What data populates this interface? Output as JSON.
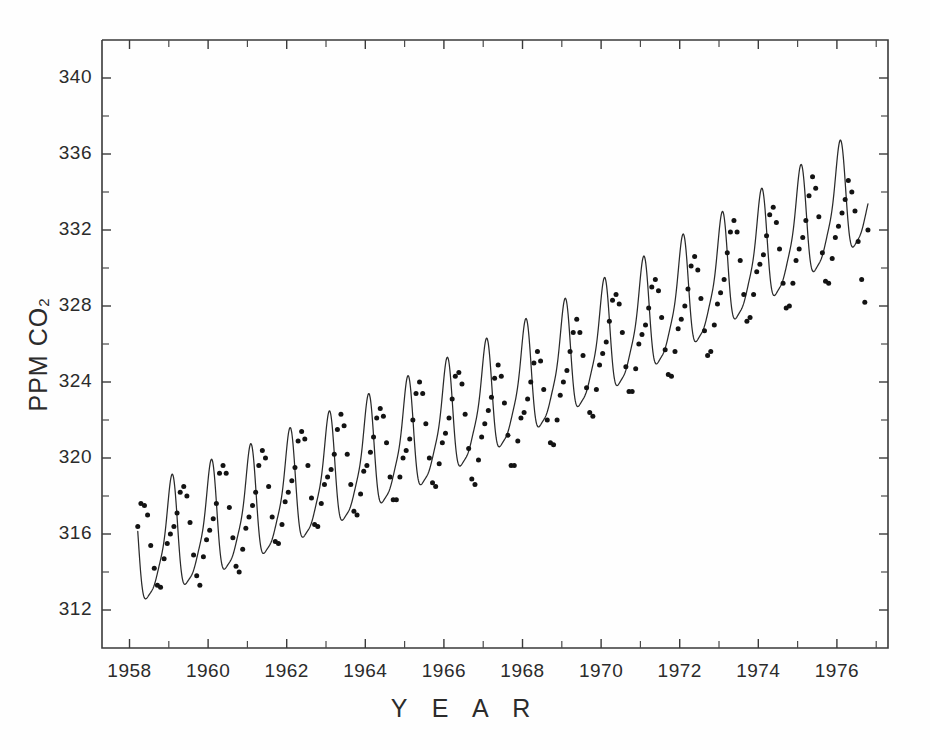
{
  "figure": {
    "background": "#fefefe",
    "ink_color": "#2b2b2b"
  },
  "axes": {
    "x_title": "Y E A R",
    "y_title_main": "PPM CO",
    "y_title_sub": "2",
    "x_tick_labels": [
      "1958",
      "1960",
      "1962",
      "1964",
      "1966",
      "1968",
      "1970",
      "1972",
      "1974",
      "1976"
    ],
    "y_tick_labels": [
      "340",
      "336",
      "332",
      "328",
      "324",
      "320",
      "316",
      "312"
    ]
  },
  "chart_data": {
    "type": "line",
    "title": "",
    "subtitle": "",
    "xlabel": "Y E A R",
    "ylabel": "PPM CO2",
    "xlim": [
      1957.3,
      1977.3
    ],
    "ylim": [
      310.0,
      342.0
    ],
    "grid": false,
    "legend": null,
    "x_major_ticks": [
      1958,
      1960,
      1962,
      1964,
      1966,
      1968,
      1970,
      1972,
      1974,
      1976
    ],
    "x_minor_ticks": [
      1959,
      1961,
      1963,
      1965,
      1967,
      1969,
      1971,
      1973,
      1975,
      1977
    ],
    "y_major_ticks": [
      312,
      316,
      320,
      324,
      328,
      332,
      336,
      340
    ],
    "y_minor_ticks": [
      314,
      318,
      322,
      326,
      330,
      334,
      338
    ],
    "series": [
      {
        "name": "Monthly mean CO2 (Mauna Loa)",
        "marker": "dot",
        "x": [
          1958.21,
          1958.29,
          1958.38,
          1958.46,
          1958.54,
          1958.63,
          1958.71,
          1958.79,
          1958.88,
          1958.96,
          1959.04,
          1959.13,
          1959.21,
          1959.29,
          1959.38,
          1959.46,
          1959.54,
          1959.63,
          1959.71,
          1959.79,
          1959.88,
          1959.96,
          1960.04,
          1960.13,
          1960.21,
          1960.29,
          1960.38,
          1960.46,
          1960.54,
          1960.63,
          1960.71,
          1960.79,
          1960.88,
          1960.96,
          1961.04,
          1961.13,
          1961.21,
          1961.29,
          1961.38,
          1961.46,
          1961.54,
          1961.63,
          1961.71,
          1961.79,
          1961.88,
          1961.96,
          1962.04,
          1962.13,
          1962.21,
          1962.29,
          1962.38,
          1962.46,
          1962.54,
          1962.63,
          1962.71,
          1962.79,
          1962.88,
          1962.96,
          1963.04,
          1963.13,
          1963.21,
          1963.29,
          1963.38,
          1963.46,
          1963.54,
          1963.63,
          1963.71,
          1963.79,
          1963.88,
          1963.96,
          1964.04,
          1964.13,
          1964.21,
          1964.29,
          1964.38,
          1964.46,
          1964.54,
          1964.63,
          1964.71,
          1964.79,
          1964.88,
          1964.96,
          1965.04,
          1965.13,
          1965.21,
          1965.29,
          1965.38,
          1965.46,
          1965.54,
          1965.63,
          1965.71,
          1965.79,
          1965.88,
          1965.96,
          1966.04,
          1966.13,
          1966.21,
          1966.29,
          1966.38,
          1966.46,
          1966.54,
          1966.63,
          1966.71,
          1966.79,
          1966.88,
          1966.96,
          1967.04,
          1967.13,
          1967.21,
          1967.29,
          1967.38,
          1967.46,
          1967.54,
          1967.63,
          1967.71,
          1967.79,
          1967.88,
          1967.96,
          1968.04,
          1968.13,
          1968.21,
          1968.29,
          1968.38,
          1968.46,
          1968.54,
          1968.63,
          1968.71,
          1968.79,
          1968.88,
          1968.96,
          1969.04,
          1969.13,
          1969.21,
          1969.29,
          1969.38,
          1969.46,
          1969.54,
          1969.63,
          1969.71,
          1969.79,
          1969.88,
          1969.96,
          1970.04,
          1970.13,
          1970.21,
          1970.29,
          1970.38,
          1970.46,
          1970.54,
          1970.63,
          1970.71,
          1970.79,
          1970.88,
          1970.96,
          1971.04,
          1971.13,
          1971.21,
          1971.29,
          1971.38,
          1971.46,
          1971.54,
          1971.63,
          1971.71,
          1971.79,
          1971.88,
          1971.96,
          1972.04,
          1972.13,
          1972.21,
          1972.29,
          1972.38,
          1972.46,
          1972.54,
          1972.63,
          1972.71,
          1972.79,
          1972.88,
          1972.96,
          1973.04,
          1973.13,
          1973.21,
          1973.29,
          1973.38,
          1973.46,
          1973.54,
          1973.63,
          1973.71,
          1973.79,
          1973.88,
          1973.96,
          1974.04,
          1974.13,
          1974.21,
          1974.29,
          1974.38,
          1974.46,
          1974.54,
          1974.63,
          1974.71,
          1974.79,
          1974.88,
          1974.96,
          1975.04,
          1975.13,
          1975.21,
          1975.29,
          1975.38,
          1975.46,
          1975.54,
          1975.63,
          1975.71,
          1975.79,
          1975.88,
          1975.96,
          1976.04,
          1976.13,
          1976.21,
          1976.29,
          1976.38,
          1976.46,
          1976.54,
          1976.63,
          1976.71,
          1976.79
        ],
        "y": [
          316.4,
          317.6,
          317.5,
          317.0,
          315.4,
          314.2,
          313.3,
          313.2,
          314.7,
          315.5,
          316.0,
          316.4,
          317.1,
          318.2,
          318.5,
          318.0,
          316.6,
          314.9,
          313.8,
          313.3,
          314.8,
          315.7,
          316.2,
          316.8,
          317.6,
          319.2,
          319.6,
          319.2,
          317.4,
          315.8,
          314.3,
          314.0,
          315.2,
          316.3,
          316.9,
          317.5,
          318.2,
          319.6,
          320.4,
          320.0,
          318.5,
          316.9,
          315.6,
          315.5,
          316.5,
          317.7,
          318.2,
          318.8,
          319.5,
          320.9,
          321.4,
          321.0,
          319.6,
          317.9,
          316.5,
          316.4,
          317.6,
          318.6,
          319.0,
          319.4,
          320.2,
          321.5,
          322.3,
          321.7,
          320.2,
          318.6,
          317.2,
          317.0,
          318.1,
          319.3,
          319.6,
          320.3,
          321.1,
          322.1,
          322.6,
          322.2,
          320.8,
          319.0,
          317.8,
          317.8,
          319.0,
          320.0,
          320.4,
          321.0,
          322.0,
          323.4,
          324.0,
          323.4,
          321.8,
          320.0,
          318.7,
          318.5,
          319.7,
          320.8,
          321.3,
          322.1,
          323.1,
          324.3,
          324.5,
          323.9,
          322.3,
          320.5,
          318.9,
          318.6,
          319.9,
          321.1,
          321.8,
          322.5,
          323.2,
          324.2,
          324.9,
          324.3,
          322.9,
          321.2,
          319.6,
          319.6,
          320.9,
          322.1,
          322.4,
          323.1,
          324.0,
          325.0,
          325.6,
          325.1,
          323.6,
          322.0,
          320.8,
          320.7,
          322.0,
          323.3,
          324.0,
          324.6,
          325.6,
          326.6,
          327.3,
          326.6,
          325.4,
          323.7,
          322.4,
          322.2,
          323.6,
          324.9,
          325.5,
          326.1,
          327.2,
          328.3,
          328.6,
          328.1,
          326.6,
          324.8,
          323.5,
          323.5,
          324.7,
          326.0,
          326.5,
          327.0,
          327.9,
          329.0,
          329.4,
          328.8,
          327.4,
          325.7,
          324.4,
          324.3,
          325.6,
          326.8,
          327.3,
          328.0,
          328.9,
          330.1,
          330.6,
          329.9,
          328.4,
          326.7,
          325.4,
          325.6,
          327.0,
          328.1,
          328.7,
          329.4,
          330.8,
          331.9,
          332.5,
          331.9,
          330.4,
          328.6,
          327.2,
          327.4,
          328.6,
          329.8,
          330.2,
          330.7,
          331.7,
          332.8,
          333.2,
          332.4,
          331.0,
          329.2,
          327.9,
          328.0,
          329.2,
          330.4,
          331.0,
          331.6,
          332.5,
          333.8,
          334.8,
          334.2,
          332.7,
          330.8,
          329.3,
          329.2,
          330.5,
          331.6,
          332.2,
          332.9,
          333.6,
          334.6,
          334.0,
          333.0,
          331.4,
          329.4,
          328.2,
          332.0
        ]
      }
    ],
    "fit_curve": {
      "name": "Fitted seasonal + trend curve",
      "description": "Smooth spline through monthly means showing annual cycle superimposed on rising trend",
      "trend_start_ppm": 315.3,
      "trend_end_ppm": 332.0,
      "seasonal_amplitude_ppm": 6.0
    },
    "annotations": []
  }
}
